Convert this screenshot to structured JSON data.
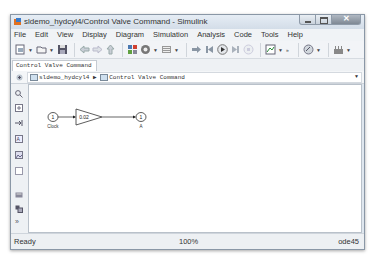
{
  "window": {
    "title": "sldemo_hydcyl4/Control Valve Command - Simulink",
    "controls": {
      "minimize": "minimize",
      "maximize": "maximize",
      "close": "✕"
    }
  },
  "menu": {
    "items": [
      "File",
      "Edit",
      "View",
      "Display",
      "Diagram",
      "Simulation",
      "Analysis",
      "Code",
      "Tools",
      "Help"
    ]
  },
  "toolbar": {
    "icons": [
      "new-model-icon",
      "open-icon",
      "save-icon",
      "back-icon",
      "forward-icon",
      "up-icon",
      "library-browser-icon",
      "model-config-icon",
      "model-explorer-icon",
      "step-back-icon",
      "step-back-icon-2",
      "run-icon",
      "step-forward-icon",
      "stop-icon",
      "scope-icon",
      "more-icon",
      "model-advisor-icon",
      "build-icon"
    ]
  },
  "tab": {
    "label": "Control Valve Command"
  },
  "breadcrumb": {
    "root": "sldemo_hydcyl4",
    "separator": "▶",
    "current": "Control Valve Command"
  },
  "palette": {
    "icons": [
      "zoom-icon",
      "fit-view-icon",
      "arrow-icon",
      "annotation-icon",
      "image-icon",
      "area-icon",
      "model-browser-icon",
      "block-icon",
      "more-icon"
    ]
  },
  "diagram": {
    "blocks": [
      {
        "name": "Clock",
        "type": "inport",
        "number": "1",
        "label": "Clock"
      },
      {
        "name": "Gain",
        "type": "gain",
        "value": "0.02"
      },
      {
        "name": "A",
        "type": "outport",
        "number": "1",
        "label": "A"
      }
    ]
  },
  "status": {
    "left": "Ready",
    "zoom": "100%",
    "solver": "ode45"
  },
  "colors": {
    "titlebar": "#d3dde8",
    "canvas": "#ffffff",
    "chrome": "#f0f3f6"
  }
}
